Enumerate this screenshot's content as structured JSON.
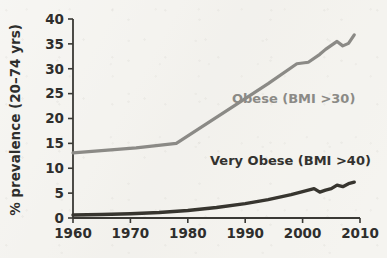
{
  "figure": {
    "background_color": "#f4f3ef",
    "plot_area": {
      "left": 73,
      "right": 360,
      "top": 19,
      "bottom": 218
    }
  },
  "chart_data": {
    "type": "line",
    "title": "",
    "subtitle": "",
    "xlabel": "",
    "ylabel": "% prevalence (20–74 yrs)",
    "xlim": [
      1960,
      2010
    ],
    "ylim": [
      0,
      40
    ],
    "xticks": [
      1960,
      1970,
      1980,
      1990,
      2000,
      2010
    ],
    "xtick_labels": [
      "1960",
      "1970",
      "1980",
      "1990",
      "2000",
      "2010"
    ],
    "yticks": [
      0,
      5,
      10,
      15,
      20,
      25,
      30,
      35,
      40
    ],
    "ytick_labels": [
      "0",
      "5",
      "10",
      "15",
      "20",
      "25",
      "30",
      "35",
      "40"
    ],
    "grid": false,
    "legend_position": "inline-annotation",
    "series": [
      {
        "name": "Obese (BMI >30)",
        "color": "#8b8a86",
        "line_width": 3.2,
        "label_text": "Obese (BMI >30)",
        "label_x": 1990.5,
        "label_y": 23.5,
        "x": [
          1960,
          1971,
          1978,
          1988,
          1994,
          1999,
          2001,
          2003,
          2004,
          2006,
          2007,
          2008,
          2009
        ],
        "y": [
          13.1,
          14.1,
          15.0,
          22.5,
          27.0,
          31.0,
          31.3,
          32.9,
          33.9,
          35.5,
          34.6,
          35.1,
          36.8
        ]
      },
      {
        "name": "Very Obese (BMI >40)",
        "color": "#37352f",
        "line_width": 3.4,
        "label_text": "Very Obese (BMI >40)",
        "label_x": 1987.5,
        "label_y": 10.8,
        "x": [
          1960,
          1965,
          1970,
          1975,
          1980,
          1985,
          1990,
          1994,
          1998,
          2001,
          2002,
          2003,
          2004,
          2005,
          2006,
          2007,
          2008,
          2009
        ],
        "y": [
          0.6,
          0.7,
          0.85,
          1.1,
          1.5,
          2.1,
          2.9,
          3.7,
          4.7,
          5.6,
          5.9,
          5.2,
          5.6,
          5.9,
          6.6,
          6.3,
          6.9,
          7.2
        ]
      }
    ],
    "annotations": [
      {
        "name": "obese-series-label",
        "text": "Obese (BMI >30)",
        "color": "#8b8a86"
      },
      {
        "name": "very-obese-series-label",
        "text": "Very Obese (BMI >40)",
        "color": "#37352f"
      }
    ]
  },
  "axis_style": {
    "axis_color": "#3a3935",
    "axis_width": 1.8,
    "tick_length": 5
  }
}
